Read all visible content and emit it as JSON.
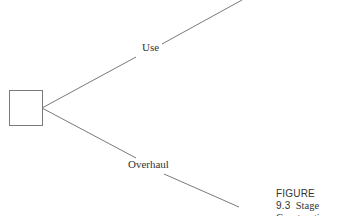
{
  "diagram": {
    "type": "decision-tree",
    "decision_node": {
      "shape": "square"
    },
    "branches": [
      {
        "label": "Use"
      },
      {
        "label": "Overhaul"
      }
    ]
  },
  "caption": {
    "figure_number": "FIGURE 9.3",
    "text_line1": "Stage",
    "text_line2": "Construction."
  },
  "colors": {
    "line": "#7a7a7a",
    "text": "#333333"
  }
}
